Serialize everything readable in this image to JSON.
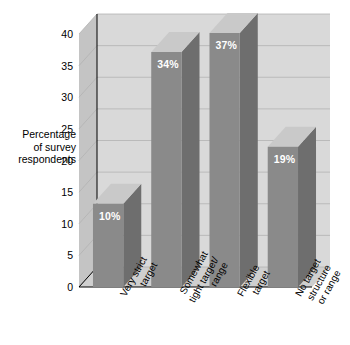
{
  "chart_data": {
    "type": "bar",
    "title": "",
    "subtitle": "",
    "xlabel": "",
    "ylabel": "Percentage of survey respondents",
    "ylim": [
      0,
      40
    ],
    "yticks": [
      0,
      5,
      10,
      15,
      20,
      25,
      30,
      35,
      40
    ],
    "grid": true,
    "legend": "none",
    "three_d": true,
    "categories": [
      "Very strict target",
      "Somewhat tight target/ range",
      "Flexible target",
      "No target structure or range"
    ],
    "category_lines": [
      [
        "Very strict",
        "target"
      ],
      [
        "Somewhat",
        "tight target/",
        "range"
      ],
      [
        "Flexible",
        "target"
      ],
      [
        "No target",
        "structure",
        "or range"
      ]
    ],
    "values": [
      10,
      34,
      37,
      19
    ],
    "data_labels": [
      "10%",
      "34%",
      "37%",
      "19%"
    ],
    "colors": {
      "bar_front": "#8a8a8a",
      "bar_side": "#6e6e6e",
      "bar_top": "#c9c9c9",
      "wall_back": "#d9d9d9",
      "wall_left": "#c4c4c4",
      "floor": "#cfcfcf",
      "gridline": "#b3b3b3",
      "axis": "#000000",
      "label_text": "#ffffff",
      "background": "#ffffff"
    }
  },
  "axis": {
    "y_title_lines": [
      "Percentage",
      "of survey",
      "respondents"
    ],
    "tick_labels": [
      "0",
      "5",
      "10",
      "15",
      "20",
      "25",
      "30",
      "35",
      "40"
    ]
  }
}
